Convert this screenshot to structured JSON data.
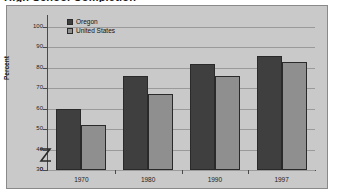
{
  "title_clipped": "High School Completion",
  "frame": {
    "background_color": "#c9c9c9",
    "border_color": "#8a8a8a"
  },
  "legend": {
    "position": "top-left-inside-plot",
    "entries": [
      {
        "label": "Oregon",
        "color": "#3f3f3f",
        "swatch_name": "legend-swatch-oregon"
      },
      {
        "label": "United States",
        "color": "#8f8f8f",
        "swatch_name": "legend-swatch-united-states"
      }
    ]
  },
  "axis": {
    "y_title": "Percent",
    "y_ticks": [
      "0",
      "30",
      "40",
      "50",
      "60",
      "70",
      "80",
      "90",
      "100"
    ],
    "y_break_between": "0 and 30",
    "y_break_icon": "axis-break-zigzag-icon"
  },
  "chart_data": {
    "type": "bar",
    "title": "High School Completion",
    "xlabel": "",
    "ylabel": "Percent",
    "ylim": [
      30,
      100
    ],
    "y_axis_break": true,
    "y_ticks": [
      0,
      30,
      40,
      50,
      60,
      70,
      80,
      90,
      100
    ],
    "grid": true,
    "legend_position": "top-left",
    "categories": [
      "1970",
      "1980",
      "1990",
      "1997"
    ],
    "series": [
      {
        "name": "Oregon",
        "color": "#3f3f3f",
        "values": [
          60,
          76,
          82,
          86
        ]
      },
      {
        "name": "United States",
        "color": "#8f8f8f",
        "values": [
          52,
          67,
          76,
          83
        ]
      }
    ]
  }
}
